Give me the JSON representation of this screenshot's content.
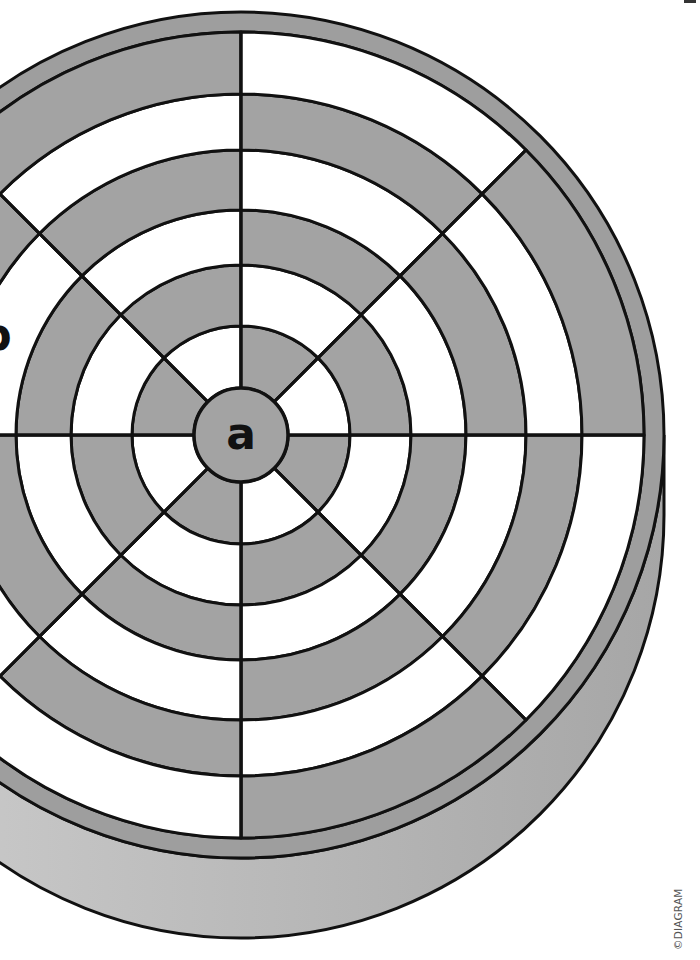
{
  "figure": {
    "type": "dartboard-target-illustration",
    "center": {
      "x": 241,
      "y": 435
    },
    "center_label": "a",
    "side_label": "b",
    "segments": 8,
    "ring_edges": [
      47,
      109,
      170,
      225,
      285,
      341,
      403
    ],
    "rim_outer_radius": 423,
    "base_depth": 80,
    "segment_first_fill": [
      "gray",
      "white",
      "gray",
      "white",
      "gray",
      "white",
      "gray",
      "white"
    ],
    "colors": {
      "gray": "#a3a3a3",
      "white": "#ffffff",
      "line": "#111111",
      "rim": "#9e9e9e",
      "base_light": "#cfcfcf",
      "base_dark": "#a6a6a6"
    }
  },
  "copyright": "©DIAGRAM"
}
